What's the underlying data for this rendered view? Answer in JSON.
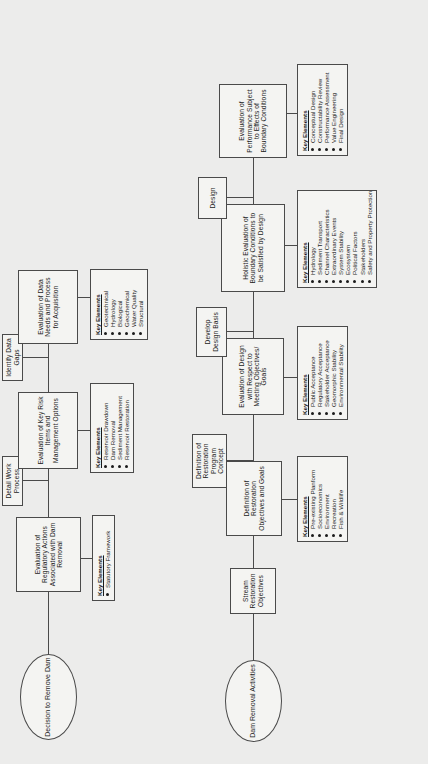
{
  "diagram": {
    "orientation": "rotated-90",
    "key_elements_label": "Key Elements",
    "chains": {
      "regulatory_chain_label": "Dam Removal Activities chain",
      "restoration_chain_label": "Stream Restoration Objectives chain"
    }
  },
  "nodes": {
    "decision_to_remove_dam": "Decision to Remove Dam",
    "dam_removal_activities": "Dam Removal Activities",
    "stream_restoration_objectives": "Stream Restoration Objectives",
    "detail_work_process": "Detail Work Process",
    "identify_data_gaps": "Identify Data Gaps",
    "develop_design_basis": "Develop Design Basis",
    "design": "Design",
    "eval_regulatory_actions": "Evaluation of Regulatory Actions Associated with Dam Removal",
    "eval_key_risk_items": "Evaluation of Key Risk Items and Management Options",
    "eval_data_needs": "Evaluation of Data Needs and Process for Acquisition",
    "definition_objectives_goals": "Definition of Restoration Objectives and Goals",
    "definition_program_concept": "Definition of Restoration Program Concept",
    "eval_design_respect_goals": "Evaluation of Design with Respect to Meeting Objectives/ Goals",
    "holistic_boundary_conditions": "Holistic Evaluation of Boundary Conditions to be Satisfied by Design",
    "eval_performance_boundary": "Evaluation of Performance Subject to Effects of Boundary Conditions"
  },
  "key_elements": {
    "regulatory": {
      "title": "Key Elements",
      "items": [
        "Statutory Framework"
      ]
    },
    "risk_items": {
      "title": "Key Elements",
      "items": [
        "Reservoir Drawdown",
        "Dam Removal",
        "Sediment Management",
        "Reservoir Restoration"
      ]
    },
    "data_needs": {
      "title": "Key Elements",
      "items": [
        "Geotechnical",
        "Hydrology",
        "Biological",
        "Geochemical",
        "Water Quality",
        "Structural"
      ]
    },
    "objectives_goals": {
      "title": "Key Elements",
      "items": [
        "Pre-existing Planform",
        "Socioeconomics",
        "Environment",
        "Recreation",
        "Fish & Wildlife"
      ]
    },
    "design_goals": {
      "title": "Key Elements",
      "items": [
        "Public Acceptance",
        "Regulatory Acceptance",
        "Stakeholder Acceptance",
        "Geomorphic Stability",
        "Environmental Stability"
      ]
    },
    "boundary_conditions": {
      "title": "Key Elements",
      "items": [
        "Hydrology",
        "Sediment Transport",
        "Channel Characteristics",
        "Extraordinary Events",
        "System Stability",
        "Ecosystem",
        "Political Factors",
        "Stakeholders",
        "Safety and Property Protection"
      ]
    },
    "performance": {
      "title": "Key Elements",
      "items": [
        "Conceptual Design",
        "Constructability Review",
        "Performance Assessment",
        "Value Engineering",
        "Final Design"
      ]
    }
  },
  "colors": {
    "page_background": "#ececeb",
    "node_fill": "#f4f4f2",
    "line": "#4a4a4a",
    "text": "#1b1b1b"
  }
}
